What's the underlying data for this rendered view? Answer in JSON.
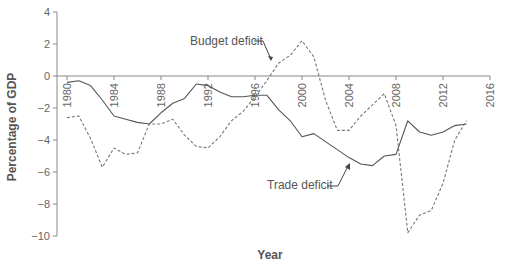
{
  "chart_data": {
    "type": "line",
    "title": "",
    "xlabel": "Year",
    "ylabel": "Percentage of GDP",
    "xlim": [
      1980,
      2016
    ],
    "ylim": [
      -10,
      4
    ],
    "x_ticks": [
      1980,
      1984,
      1988,
      1992,
      1996,
      2000,
      2004,
      2008,
      2012,
      2016
    ],
    "y_ticks": [
      4,
      2,
      0,
      -2,
      -4,
      -6,
      -8,
      -10
    ],
    "grid": false,
    "legend": "annotations",
    "x": [
      1980,
      1981,
      1982,
      1983,
      1984,
      1985,
      1986,
      1987,
      1988,
      1989,
      1990,
      1991,
      1992,
      1993,
      1994,
      1995,
      1996,
      1997,
      1998,
      1999,
      2000,
      2001,
      2002,
      2003,
      2004,
      2005,
      2006,
      2007,
      2008,
      2009,
      2010,
      2011,
      2012,
      2013,
      2014
    ],
    "series": [
      {
        "name": "Trade deficit",
        "style": "solid",
        "color": "#555555",
        "values": [
          -0.4,
          -0.3,
          -0.6,
          -1.5,
          -2.5,
          -2.7,
          -2.9,
          -3.0,
          -2.3,
          -1.7,
          -1.4,
          -0.5,
          -0.6,
          -1.0,
          -1.3,
          -1.3,
          -1.2,
          -1.2,
          -2.1,
          -2.8,
          -3.8,
          -3.6,
          -4.1,
          -4.6,
          -5.1,
          -5.5,
          -5.6,
          -5.0,
          -4.9,
          -2.8,
          -3.5,
          -3.7,
          -3.5,
          -3.1,
          -3.0
        ]
      },
      {
        "name": "Budget deficit",
        "style": "dashed",
        "color": "#777777",
        "values": [
          -2.6,
          -2.5,
          -3.9,
          -5.7,
          -4.5,
          -4.9,
          -4.8,
          -3.0,
          -3.0,
          -2.7,
          -3.7,
          -4.4,
          -4.5,
          -3.8,
          -2.8,
          -2.2,
          -1.3,
          -0.3,
          0.8,
          1.3,
          2.2,
          1.2,
          -1.5,
          -3.4,
          -3.4,
          -2.5,
          -1.8,
          -1.1,
          -3.1,
          -9.8,
          -8.7,
          -8.4,
          -6.7,
          -4.0,
          -2.8
        ]
      }
    ],
    "annotations": [
      {
        "text": "Budget deficit",
        "points_to_year": 1997.5
      },
      {
        "text": "Trade deficit",
        "points_to_year": 2004
      }
    ]
  }
}
